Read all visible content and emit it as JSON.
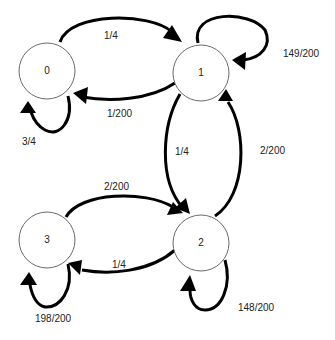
{
  "diagram": {
    "type": "markov-chain-state-diagram",
    "nodes": [
      {
        "id": "0",
        "label": "0"
      },
      {
        "id": "1",
        "label": "1"
      },
      {
        "id": "2",
        "label": "2"
      },
      {
        "id": "3",
        "label": "3"
      }
    ],
    "edges": [
      {
        "from": "0",
        "to": "1",
        "label": "1/4"
      },
      {
        "from": "1",
        "to": "0",
        "label": "1/200"
      },
      {
        "from": "0",
        "to": "0",
        "label": "3/4"
      },
      {
        "from": "1",
        "to": "1",
        "label": "149/200"
      },
      {
        "from": "1",
        "to": "2",
        "label": "1/4"
      },
      {
        "from": "2",
        "to": "1",
        "label": "2/200"
      },
      {
        "from": "3",
        "to": "2",
        "label": "2/200"
      },
      {
        "from": "2",
        "to": "3",
        "label": "1/4"
      },
      {
        "from": "2",
        "to": "2",
        "label": "148/200"
      },
      {
        "from": "3",
        "to": "3",
        "label": "198/200"
      }
    ]
  }
}
